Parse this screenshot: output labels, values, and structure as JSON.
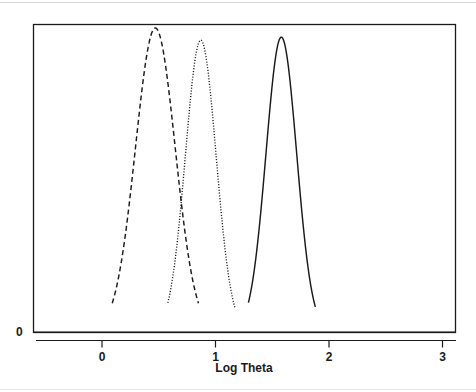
{
  "figure": {
    "width": 476,
    "height": 392,
    "background": "#ffffff",
    "ink_color": "#1a1a1a"
  },
  "chart_data": {
    "type": "line",
    "title": "",
    "subtitle": "",
    "xlabel": "Log Theta",
    "ylabel": "",
    "xlim": [
      -0.58,
      3.12
    ],
    "ylim": [
      0,
      1.08
    ],
    "xticks": [
      0,
      1,
      2,
      3
    ],
    "xticklabels": [
      "0",
      "1",
      "2",
      "3"
    ],
    "yticks": [
      0
    ],
    "yticklabels": [
      "0"
    ],
    "grid": false,
    "legend": null,
    "frame": "box",
    "series": [
      {
        "name": "dashed-density",
        "linestyle": "dashed",
        "color": "#1a1a1a",
        "peak_x": 0.47,
        "peak_y": 1.0,
        "sigma": 0.175,
        "x_start": 0.09,
        "x_end": 0.85
      },
      {
        "name": "dotted-density",
        "linestyle": "dotted",
        "color": "#1a1a1a",
        "peak_x": 0.87,
        "peak_y": 0.96,
        "sigma": 0.135,
        "x_start": 0.58,
        "x_end": 1.17
      },
      {
        "name": "solid-density",
        "linestyle": "solid",
        "color": "#1a1a1a",
        "peak_x": 1.58,
        "peak_y": 0.97,
        "sigma": 0.135,
        "x_start": 1.29,
        "x_end": 1.88
      }
    ]
  },
  "axes": {
    "x_axis_title": "Log Theta",
    "x_tick_labels": [
      "0",
      "1",
      "2",
      "3"
    ],
    "y_zero_label": "0"
  }
}
